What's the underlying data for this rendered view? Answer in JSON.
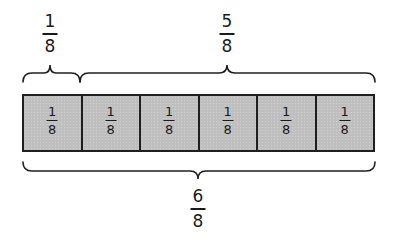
{
  "diagram": {
    "type": "fraction-strip",
    "title": "",
    "top_labels": [
      {
        "numerator": "1",
        "denominator": "8",
        "spans_cells": 1
      },
      {
        "numerator": "5",
        "denominator": "8",
        "spans_cells": 5
      }
    ],
    "cells": [
      {
        "numerator": "1",
        "denominator": "8"
      },
      {
        "numerator": "1",
        "denominator": "8"
      },
      {
        "numerator": "1",
        "denominator": "8"
      },
      {
        "numerator": "1",
        "denominator": "8"
      },
      {
        "numerator": "1",
        "denominator": "8"
      },
      {
        "numerator": "1",
        "denominator": "8"
      }
    ],
    "bottom_label": {
      "numerator": "6",
      "denominator": "8",
      "spans_cells": 6
    },
    "colors": {
      "cell_fill": "#bfbfbf",
      "stroke": "#1f1f1f",
      "background": "#ffffff"
    }
  }
}
